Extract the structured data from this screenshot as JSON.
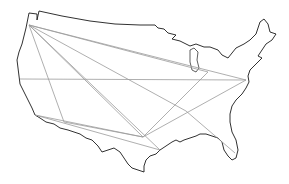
{
  "map": {
    "subject": "Contiguous United States outline with connecting routes",
    "colors": {
      "background": "#ffffff",
      "outline": "#1a1a1a",
      "routes": "#9a9a9a"
    },
    "nodes": [
      {
        "id": "seattle",
        "x": 29,
        "y": 25
      },
      {
        "id": "san-francisco",
        "x": 20,
        "y": 79
      },
      {
        "id": "los-angeles",
        "x": 35,
        "y": 115
      },
      {
        "id": "phoenix",
        "x": 64,
        "y": 122
      },
      {
        "id": "chicago",
        "x": 208,
        "y": 72
      },
      {
        "id": "new-york",
        "x": 246,
        "y": 80
      },
      {
        "id": "houston",
        "x": 143,
        "y": 137
      },
      {
        "id": "atlanta",
        "x": 186,
        "y": 111
      },
      {
        "id": "new-orleans",
        "x": 160,
        "y": 150
      },
      {
        "id": "miami",
        "x": 235,
        "y": 153
      }
    ],
    "routes": [
      {
        "from": "seattle",
        "to": "chicago"
      },
      {
        "from": "seattle",
        "to": "new-york"
      },
      {
        "from": "seattle",
        "to": "houston"
      },
      {
        "from": "seattle",
        "to": "atlanta"
      },
      {
        "from": "seattle",
        "to": "phoenix"
      },
      {
        "from": "seattle",
        "to": "new-orleans"
      },
      {
        "from": "san-francisco",
        "to": "new-york"
      },
      {
        "from": "los-angeles",
        "to": "houston"
      },
      {
        "from": "los-angeles",
        "to": "new-orleans"
      },
      {
        "from": "houston",
        "to": "chicago"
      },
      {
        "from": "houston",
        "to": "new-york"
      },
      {
        "from": "atlanta",
        "to": "miami"
      },
      {
        "from": "phoenix",
        "to": "houston"
      }
    ]
  }
}
